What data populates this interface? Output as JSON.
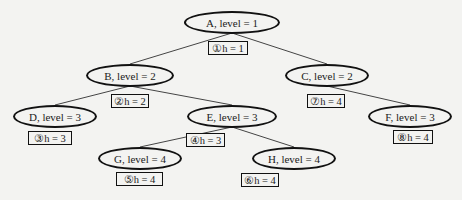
{
  "diagram": {
    "type": "tree",
    "nodes": [
      {
        "id": "A",
        "label": "A, level = 1",
        "cx": 232,
        "cy": 22,
        "w": 96,
        "annotation": "①h = 1",
        "ax": 208,
        "ay": 41,
        "aw": 40
      },
      {
        "id": "B",
        "label": "B, level = 2",
        "cx": 130,
        "cy": 75,
        "w": 88,
        "annotation": "②h = 2",
        "ax": 111,
        "ay": 94,
        "aw": 38
      },
      {
        "id": "C",
        "label": "C, level = 2",
        "cx": 327,
        "cy": 75,
        "w": 84,
        "annotation": "⑦h = 4",
        "ax": 307,
        "ay": 94,
        "aw": 38
      },
      {
        "id": "D",
        "label": "D, level = 3",
        "cx": 55,
        "cy": 116,
        "w": 84,
        "annotation": "③h = 3",
        "ax": 28,
        "ay": 131,
        "aw": 44
      },
      {
        "id": "E",
        "label": "E, level = 3",
        "cx": 232,
        "cy": 116,
        "w": 90,
        "annotation": "④h = 3",
        "ax": 186,
        "ay": 133,
        "aw": 39
      },
      {
        "id": "F",
        "label": "F, level = 3",
        "cx": 410,
        "cy": 116,
        "w": 84,
        "annotation": "⑧h = 4",
        "ax": 393,
        "ay": 130,
        "aw": 40
      },
      {
        "id": "G",
        "label": "G, level = 4",
        "cx": 140,
        "cy": 158,
        "w": 84,
        "annotation": "⑤h = 4",
        "ax": 116,
        "ay": 172,
        "aw": 47
      },
      {
        "id": "H",
        "label": "H, level = 4",
        "cx": 294,
        "cy": 158,
        "w": 84,
        "annotation": "⑥h = 4",
        "ax": 241,
        "ay": 173,
        "aw": 38
      }
    ],
    "edges": [
      [
        "A",
        "B"
      ],
      [
        "A",
        "C"
      ],
      [
        "B",
        "D"
      ],
      [
        "B",
        "E"
      ],
      [
        "C",
        "F"
      ],
      [
        "E",
        "G"
      ],
      [
        "E",
        "H"
      ]
    ]
  }
}
